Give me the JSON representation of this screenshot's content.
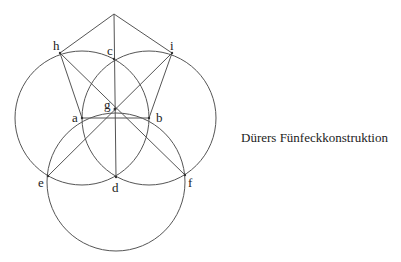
{
  "caption": "Dürers Fünfeckkonstruktion",
  "colors": {
    "stroke": "#555555",
    "text": "#222222",
    "background": "#ffffff"
  },
  "points": {
    "apex": {
      "x": 114,
      "y": 14
    },
    "h": {
      "x": 60,
      "y": 53,
      "label": "h"
    },
    "c": {
      "x": 114,
      "y": 59,
      "label": "c"
    },
    "i": {
      "x": 172,
      "y": 53,
      "label": "i"
    },
    "g": {
      "x": 115,
      "y": 109,
      "label": "g"
    },
    "a": {
      "x": 82,
      "y": 118,
      "label": "a"
    },
    "b": {
      "x": 149,
      "y": 118,
      "label": "b"
    },
    "e": {
      "x": 48,
      "y": 176,
      "label": "e"
    },
    "d": {
      "x": 116,
      "y": 177,
      "label": "d"
    },
    "f": {
      "x": 185,
      "y": 175,
      "label": "f"
    }
  },
  "circles": [
    {
      "name": "circle-a",
      "cx": 82,
      "cy": 118,
      "r": 67
    },
    {
      "name": "circle-b",
      "cx": 149,
      "cy": 118,
      "r": 67
    },
    {
      "name": "circle-d",
      "cx": 116,
      "cy": 182,
      "r": 69
    }
  ]
}
